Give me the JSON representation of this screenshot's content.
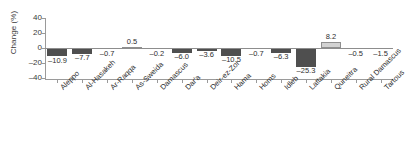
{
  "chart_data": {
    "type": "bar",
    "title": "",
    "xlabel": "",
    "ylabel": "Change (%)",
    "ylim": [
      -40,
      40
    ],
    "yticks": [
      "40",
      "20",
      "0",
      "–20",
      "–40"
    ],
    "ytick_values": [
      40,
      20,
      0,
      -20,
      -40
    ],
    "grid": false,
    "legend": "none",
    "categories": [
      "Aleppo",
      "Al-Hasakeh",
      "Ar-Raqqa",
      "As-Sweida",
      "Damascus",
      "Dar'a",
      "Deir-ez-Zor",
      "Hama",
      "Homs",
      "Idleb",
      "Lattakia",
      "Quneitra",
      "Rural Damascus",
      "Tartous"
    ],
    "values": [
      -10.9,
      -7.7,
      -0.7,
      0.5,
      -0.2,
      -6.0,
      -3.6,
      -10.5,
      -0.7,
      -6.3,
      -25.3,
      8.2,
      -0.5,
      -1.5
    ],
    "value_labels": [
      "–10.9",
      "–7.7",
      "–0.7",
      "0.5",
      "–0.2",
      "–6.0",
      "–3.6",
      "–10.5",
      "–0.7",
      "–6.3",
      "–25.3",
      "8.2",
      "–0.5",
      "–1.5"
    ],
    "colors": {
      "negative_bar": "#4f4f4f",
      "positive_bar": "#d2d2d2",
      "positive_bar_border": "#8f8f8f",
      "axis": "#9a9a9a",
      "text": "#2e2e2e"
    }
  }
}
